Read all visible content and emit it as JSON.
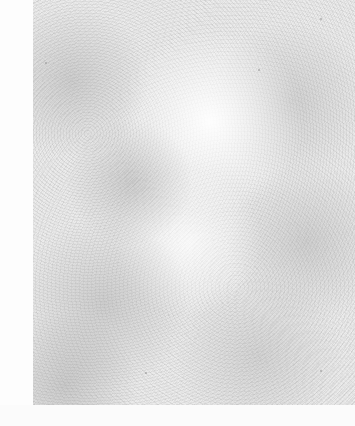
{
  "image": {
    "description": "Grayish paper/noise texture with no text or UI elements",
    "width": 355,
    "height": 426
  },
  "regions": {
    "left_margin": {
      "x": 0,
      "y": 0,
      "width": 33,
      "height": 426,
      "color": "#fdfdfd"
    },
    "texture_panel": {
      "x": 33,
      "y": 0,
      "width": 322,
      "height": 405,
      "base_color": "#ececec",
      "highlight_color": "#ffffff",
      "shadow_color": "#969696"
    },
    "bottom_band": {
      "x": 0,
      "y": 405,
      "width": 355,
      "height": 21,
      "color": "#fbfbfb"
    }
  },
  "specks": [
    {
      "x": 45,
      "y": 62
    },
    {
      "x": 258,
      "y": 69
    },
    {
      "x": 320,
      "y": 18
    },
    {
      "x": 320,
      "y": 370
    },
    {
      "x": 145,
      "y": 372
    }
  ]
}
